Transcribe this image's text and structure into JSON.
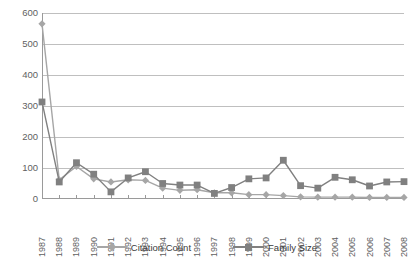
{
  "chart_data": {
    "type": "line",
    "title": "",
    "xlabel": "",
    "ylabel": "",
    "ylim": [
      0,
      600
    ],
    "ytick_step": 100,
    "yticks": [
      "0",
      "100",
      "200",
      "300",
      "400",
      "500",
      "600"
    ],
    "grid": true,
    "legend_position": "bottom",
    "categories": [
      "1987",
      "1988",
      "1989",
      "1990",
      "1991",
      "1992",
      "1993",
      "1994",
      "1995",
      "1996",
      "1997",
      "1998",
      "1999",
      "2000",
      "2001",
      "2002",
      "2003",
      "2004",
      "2005",
      "2006",
      "2007",
      "2008"
    ],
    "series": [
      {
        "name": "Citation Count",
        "marker": "diamond",
        "color": "#a6a6a6",
        "values": [
          565,
          62,
          105,
          65,
          55,
          62,
          60,
          35,
          28,
          30,
          20,
          20,
          14,
          14,
          11,
          7,
          6,
          6,
          6,
          5,
          5,
          5
        ]
      },
      {
        "name": "Family Size",
        "marker": "square",
        "color": "#808080",
        "values": [
          313,
          55,
          117,
          80,
          23,
          68,
          88,
          50,
          45,
          45,
          18,
          37,
          65,
          68,
          125,
          43,
          35,
          70,
          62,
          42,
          55,
          56
        ]
      }
    ]
  },
  "legend": {
    "items": [
      {
        "label": "Citation Count"
      },
      {
        "label": "Family Size"
      }
    ]
  },
  "colors": {
    "citation_count": "#a6a6a6",
    "family_size": "#808080",
    "gridline": "#bfbfbf",
    "axis": "#9a9a9a",
    "tick_text": "#5f5f5f",
    "legend_text": "#3a3a3a",
    "background": "#ffffff"
  }
}
